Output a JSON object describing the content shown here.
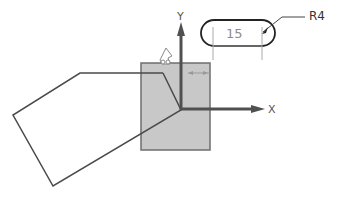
{
  "viewport": {
    "title": "Sketch viewport"
  },
  "axes": {
    "x_label": "X",
    "y_label": "Y",
    "color": "#505050"
  },
  "dimensions": {
    "length_value": "15",
    "radius_label": "R4"
  },
  "colors": {
    "background": "#ffffff",
    "square_fill": "#c8c8c8",
    "square_stroke": "#6e6e6e",
    "sketch_line": "#4a4a4a",
    "dimension_text": "#8c8c8c"
  },
  "icons": {
    "constraint_cursor": "hand-cursor-icon"
  }
}
